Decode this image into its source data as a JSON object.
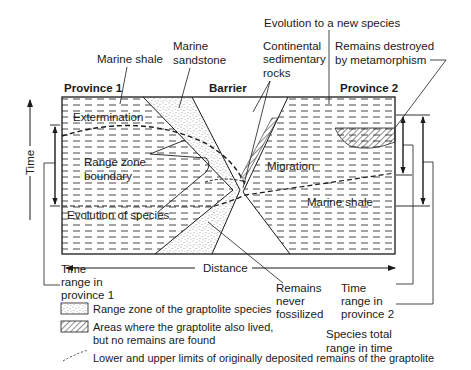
{
  "diagram": {
    "top_labels": {
      "marine_shale": "Marine shale",
      "marine_sandstone_1": "Marine",
      "marine_sandstone_2": "sandstone",
      "evolution_new_species": "Evolution to a new species",
      "continental_1": "Continental",
      "continental_2": "sedimentary",
      "continental_3": "rocks",
      "metamorphism_1": "Remains destroyed",
      "metamorphism_2": "by metamorphism"
    },
    "headers": {
      "province_1": "Province 1",
      "barrier": "Barrier",
      "province_2": "Province 2"
    },
    "inner_labels": {
      "extermination": "Extermination",
      "range_zone_1": "Range zone",
      "range_zone_2": "boundary",
      "migration": "Migration",
      "marine_shale_right": "Marine shale",
      "evolution_of_species": "Evolution of species"
    },
    "axes": {
      "time": "Time",
      "distance": "Distance"
    },
    "bottom_labels": {
      "time_range_p1_1": "Time",
      "time_range_p1_2": "range in",
      "time_range_p1_3": "province 1",
      "never_fossilized_1": "Remains",
      "never_fossilized_2": "never",
      "never_fossilized_3": "fossilized",
      "time_range_p2_1": "Time",
      "time_range_p2_2": "range in",
      "time_range_p2_3": "province 2",
      "total_range_1": "Species total",
      "total_range_2": "range in time"
    },
    "legend": [
      {
        "icon": "stipple-swatch-icon",
        "label": "Range zone of the graptolite species"
      },
      {
        "icon": "hatch-swatch-icon",
        "label_1": "Areas where the graptolite also lived,",
        "label_2": "but no remains are found"
      },
      {
        "icon": "dashed-line-icon",
        "label": "Lower and upper limits of originally deposited remains of the graptolite"
      }
    ],
    "colors": {
      "ink": "#1a1a1a",
      "background": "#ffffff"
    }
  }
}
